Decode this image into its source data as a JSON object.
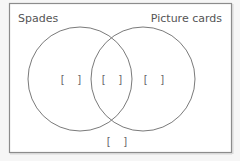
{
  "diagram": {
    "type": "venn",
    "sets": [
      {
        "id": "spades",
        "label": "Spades"
      },
      {
        "id": "picture",
        "label": "Picture cards"
      }
    ],
    "regions": {
      "spades_only": "[    ]",
      "intersection": "[    ]",
      "picture_only": "[    ]",
      "outside": "[    ]"
    },
    "colors": {
      "border": "#8c8c8c",
      "circle": "#7a7a7a",
      "background": "#ffffff",
      "page": "#f6f6f6"
    }
  }
}
